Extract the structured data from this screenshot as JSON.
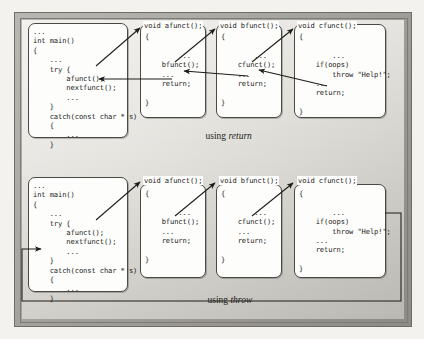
{
  "figure": {
    "captions": {
      "top": {
        "prefix": "using ",
        "keyword": "return"
      },
      "bottom": {
        "prefix": "using ",
        "keyword": "throw"
      }
    },
    "colors": {
      "frame": "#a9a7a2",
      "stage": "#e6e4df",
      "box_fill": "#fdfdfc",
      "box_border": "#4a4944",
      "text": "#232320",
      "arrow": "#1d1c19"
    }
  },
  "diagrams": [
    {
      "id": "using-return",
      "caption_prefix": "using ",
      "caption_keyword": "return",
      "boxes": [
        {
          "id": "main-return",
          "name": "main-function-box",
          "header": "",
          "code": "...\nint main()\n{\n    ...\n    try {\n        afunct();\n        nextfunct();\n        ...\n    }\n    catch(const char * s)\n    {\n        ...\n    }"
        },
        {
          "id": "afunct-return",
          "name": "afunct-function-box",
          "header": "void afunct();",
          "code": "{\n\n        ...\n    bfunct();\n    ...\n    return;\n\n}"
        },
        {
          "id": "bfunct-return",
          "name": "bfunct-function-box",
          "header": "void bfunct();",
          "code": "{\n\n        ...\n    cfunct();\n    ...\n    return;\n\n}"
        },
        {
          "id": "cfunct-return",
          "name": "cfunct-function-box",
          "header": "void cfunct();",
          "code": "{\n\n        ...\n    if(oops)\n        throw \"Help!\";\n    ...\n    return;\n\n}"
        }
      ]
    },
    {
      "id": "using-throw",
      "caption_prefix": "using ",
      "caption_keyword": "throw",
      "boxes": [
        {
          "id": "main-throw",
          "name": "main-function-box",
          "header": "",
          "code": "...\nint main()\n{\n    ...\n    try {\n        afunct();\n        nextfunct();\n        ...\n    }\n    catch(const char * s)\n    {\n        ...\n    }"
        },
        {
          "id": "afunct-throw",
          "name": "afunct-function-box",
          "header": "void afunct();",
          "code": "{\n\n        ...\n    bfunct();\n    ...\n    return;\n\n}"
        },
        {
          "id": "bfunct-throw",
          "name": "bfunct-function-box",
          "header": "void bfunct();",
          "code": "{\n\n        ...\n    cfunct();\n    ...\n    return;\n\n}"
        },
        {
          "id": "cfunct-throw",
          "name": "cfunct-function-box",
          "header": "void cfunct();",
          "code": "{\n\n        ...\n    if(oops)\n        throw \"Help!\";\n    ...\n    return;\n\n}"
        }
      ]
    }
  ]
}
